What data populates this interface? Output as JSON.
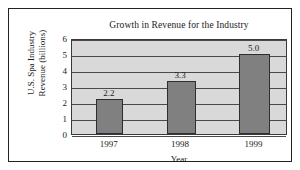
{
  "chart_data": {
    "type": "bar",
    "title": "Growth in Revenue for the Industry",
    "xlabel": "Year",
    "ylabel_lines": [
      "U.S. Spa Industry",
      "Revenue (billions)"
    ],
    "categories": [
      "1997",
      "1998",
      "1999"
    ],
    "values": [
      2.2,
      3.3,
      5.0
    ],
    "value_labels": [
      "2.2",
      "3.3",
      "5.0"
    ],
    "ylim": [
      0,
      6
    ],
    "ytick_labels": [
      "0",
      "1",
      "2",
      "3",
      "4",
      "5",
      "6"
    ],
    "ytick_values": [
      0,
      1,
      2,
      3,
      4,
      5,
      6
    ],
    "grid": true,
    "legend": "none",
    "bar_color": "#808080",
    "bar_border_color": "#2e2e2e",
    "plot_background": "#d9d9d9",
    "gridline_color": "#4a4a4a",
    "frame_color": "#222222"
  }
}
